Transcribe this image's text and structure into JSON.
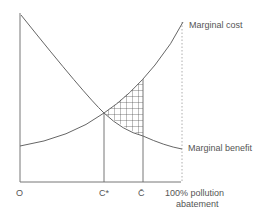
{
  "diagram": {
    "curves": {
      "marginal_cost": {
        "label": "Marginal cost"
      },
      "marginal_benefit": {
        "label": "Marginal benefit"
      }
    },
    "x_axis": {
      "origin_label": "O",
      "ticks": [
        "C*",
        "C̄"
      ],
      "end_label_line1": "100%  pollution",
      "end_label_line2": "abatement"
    },
    "colors": {
      "line": "#666666",
      "hatch": "#444444"
    }
  }
}
